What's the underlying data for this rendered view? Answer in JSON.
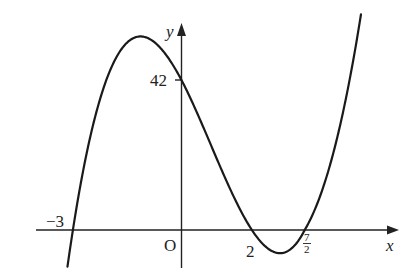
{
  "chart_data": {
    "type": "line",
    "title": "",
    "function": "y = (x + 3)(x - 2)(2x - 7)",
    "xlabel": "x",
    "ylabel": "y",
    "origin_label": "O",
    "x_intercepts": [
      {
        "value": -3,
        "label": "−3"
      },
      {
        "value": 2,
        "label": "2"
      },
      {
        "value": 3.5,
        "label": "7/2",
        "numerator": "7",
        "denominator": "2"
      }
    ],
    "y_intercept": {
      "value": 42,
      "label": "42"
    },
    "domain": [
      -3.15,
      4.85
    ],
    "grid": false,
    "legend": null,
    "series": [
      {
        "name": "cubic curve",
        "x": [
          -3.15,
          -3,
          -2.5,
          -2,
          -1.5,
          -1,
          -0.5,
          0,
          0.5,
          1,
          1.5,
          2,
          2.5,
          2.75,
          3,
          3.5,
          4,
          4.5,
          4.85
        ],
        "values": [
          -10.0,
          0,
          30,
          44,
          52.5,
          54,
          51,
          42,
          31.5,
          20,
          9,
          0,
          -5.5,
          -6.1,
          -6,
          0,
          14,
          37.5,
          59
        ]
      }
    ]
  },
  "labels": {
    "x_axis": "x",
    "y_axis": "y",
    "origin": "O",
    "neg_three": "−3",
    "two": "2",
    "seven_half_num": "7",
    "seven_half_den": "2",
    "forty_two": "42"
  }
}
